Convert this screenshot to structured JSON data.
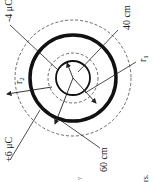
{
  "diagram": {
    "rotation_deg": -90,
    "labels": {
      "inner_charge": "-4 μC",
      "outer_charge": "+6 μC",
      "inner_radius": "40 cm",
      "outer_radius": "60 cm",
      "r1": "r",
      "r1_sub": "1",
      "r2": "r",
      "r2_sub": "2",
      "stray_text": "rs.",
      "stray_mark": "'/"
    },
    "shapes": {
      "center": [
        73,
        78
      ],
      "inner_sphere_radius": 17,
      "outer_shell_radius": 43,
      "inner_dashed_radius": 25,
      "outer_dashed_radius": 58
    },
    "colors": {
      "ink": "#222222",
      "background": "#ffffff"
    }
  }
}
